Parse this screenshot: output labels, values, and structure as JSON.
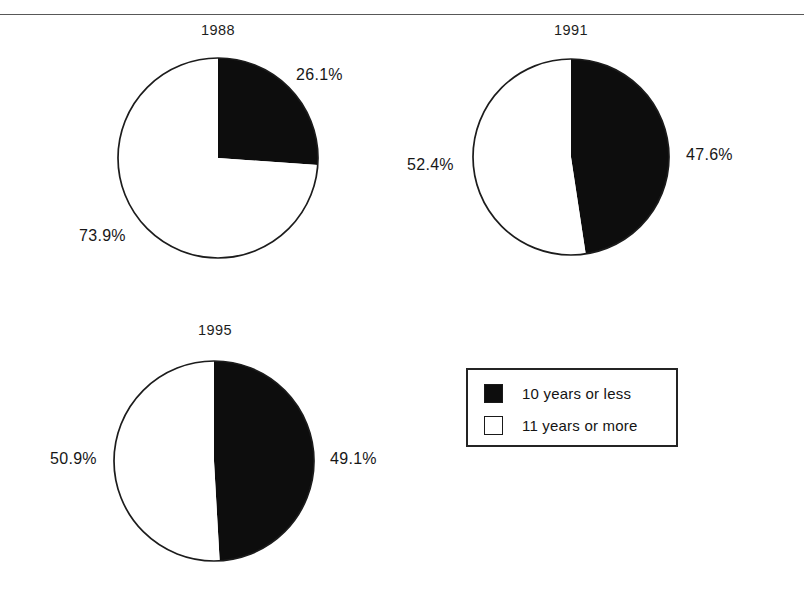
{
  "figure": {
    "artifact_text": "",
    "rule": "horizontal-rule"
  },
  "legend": {
    "items": [
      {
        "label": "10 years or less",
        "swatch": "filled-black-square",
        "color": "#0d0d0d"
      },
      {
        "label": "11 years or more",
        "swatch": "hollow-white-square",
        "color": "#ffffff"
      }
    ]
  },
  "panels": [
    {
      "title": "1988",
      "black_label": "26.1%",
      "white_label": "73.9%"
    },
    {
      "title": "1991",
      "black_label": "47.6%",
      "white_label": "52.4%"
    },
    {
      "title": "1995",
      "black_label": "49.1%",
      "white_label": "50.9%"
    }
  ],
  "chart_data": [
    {
      "type": "pie",
      "title": "1988",
      "categories": [
        "10 years or less",
        "11 years or more"
      ],
      "values": [
        26.1,
        73.9
      ],
      "labels": [
        "26.1%",
        "73.9%"
      ],
      "colors": [
        "#0d0d0d",
        "#ffffff"
      ],
      "start_angle_deg": 0,
      "direction": "clockwise",
      "legend_position": "bottom-right-shared"
    },
    {
      "type": "pie",
      "title": "1991",
      "categories": [
        "10 years or less",
        "11 years or more"
      ],
      "values": [
        47.6,
        52.4
      ],
      "labels": [
        "47.6%",
        "52.4%"
      ],
      "colors": [
        "#0d0d0d",
        "#ffffff"
      ],
      "start_angle_deg": 0,
      "direction": "clockwise",
      "legend_position": "bottom-right-shared"
    },
    {
      "type": "pie",
      "title": "1995",
      "categories": [
        "10 years or less",
        "11 years or more"
      ],
      "values": [
        49.1,
        50.9
      ],
      "labels": [
        "49.1%",
        "50.9%"
      ],
      "colors": [
        "#0d0d0d",
        "#ffffff"
      ],
      "start_angle_deg": 0,
      "direction": "clockwise",
      "legend_position": "bottom-right-shared"
    }
  ]
}
